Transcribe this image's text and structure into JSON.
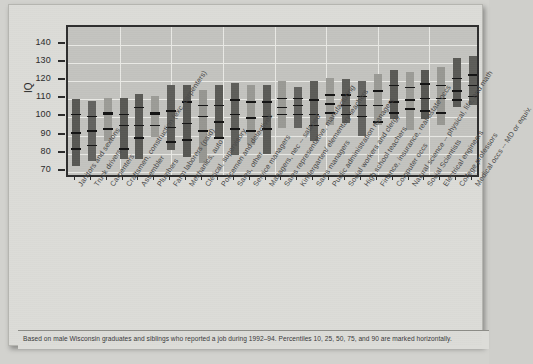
{
  "chart_data": {
    "type": "bar",
    "title": "",
    "xlabel": "",
    "ylabel": "IQ",
    "ylim": [
      66,
      150
    ],
    "yticks": [
      70,
      80,
      90,
      100,
      110,
      120,
      130,
      140
    ],
    "grid": true,
    "legend": null,
    "percentiles_marked": [
      10,
      25,
      50,
      75,
      90
    ],
    "footnote": "Based on male Wisconsin graduates and siblings who reported a job during 1992–94. Percentiles 10, 25, 50, 75, and 90 are marked horizontally.",
    "categories": [
      "Janitors and sextons",
      "Truck drivers",
      "Carpenters",
      "Craftsmen, construction (exc. carpenters)",
      "Assembler",
      "Plumbers",
      "Farm laborers (paid)",
      "Mechanics, auto",
      "Clerical, supervisory",
      "Policemen and detectives",
      "Sales, other",
      "Service managers",
      "Managers, nec -- salaried",
      "Sales representative, manufacturing",
      "Kindergarten/ elementary teachers",
      "Sales managers",
      "Public administration managers",
      "Social workers and clergy",
      "High school teachers",
      "Finance, insurance, real estate occs",
      "Computer occs",
      "Natural science -- physical, life, and math",
      "Social Scientists",
      "Electrical engineers",
      "College professors",
      "Medical occs -- MD or equiv."
    ],
    "series": [
      {
        "name": "p10",
        "values": [
          73,
          76,
          87,
          77,
          77,
          89,
          82,
          78,
          75,
          89,
          79,
          85,
          80,
          94,
          94,
          87,
          96,
          97,
          90,
          96,
          99,
          93,
          99,
          96,
          106,
          107
        ]
      },
      {
        "name": "p25",
        "values": [
          83,
          85,
          94,
          83,
          89,
          96,
          87,
          88,
          93,
          89,
          94,
          93,
          94,
          102,
          102,
          96,
          103,
          102,
          101,
          98,
          103,
          105,
          104,
          103,
          110,
          112
        ]
      },
      {
        "name": "p50",
        "values": [
          92,
          93,
          102,
          96,
          96,
          102,
          95,
          97,
          101,
          98,
          102,
          100,
          101,
          106,
          107,
          102,
          108,
          107,
          107,
          107,
          109,
          110,
          111,
          111,
          115,
          118
        ]
      },
      {
        "name": "p75",
        "values": [
          102,
          101,
          103,
          102,
          106,
          103,
          104,
          109,
          107,
          107,
          110,
          109,
          109,
          111,
          111,
          110,
          113,
          113,
          112,
          115,
          118,
          117,
          119,
          118,
          122,
          124
        ]
      },
      {
        "name": "p90",
        "values": [
          110,
          109,
          111,
          111,
          113,
          112,
          118,
          118,
          115,
          118,
          119,
          118,
          118,
          120,
          117,
          120,
          122,
          121,
          120,
          124,
          126,
          125,
          126,
          128,
          133,
          134
        ]
      }
    ],
    "bar_colors": [
      "#585854",
      "#636360",
      "#9c9c97",
      "#585854",
      "#5a5a56",
      "#9c9c97",
      "#5d5d59",
      "#575753",
      "#979792",
      "#5a5a56",
      "#5e5e5a",
      "#999994",
      "#5b5b57",
      "#9a9a95",
      "#636360",
      "#5c5c58",
      "#9b9b96",
      "#5d5d59",
      "#636360",
      "#9a9a95",
      "#5a5a56",
      "#9c9c97",
      "#575753",
      "#989893",
      "#5a5a56",
      "#5d5d59"
    ]
  },
  "figure": {
    "axis_line_color": "#2e2e2e",
    "plot_bg": "#c3c3bf",
    "grid_color": "#e9e9e5",
    "paper_bg": "#dcdcd8"
  }
}
